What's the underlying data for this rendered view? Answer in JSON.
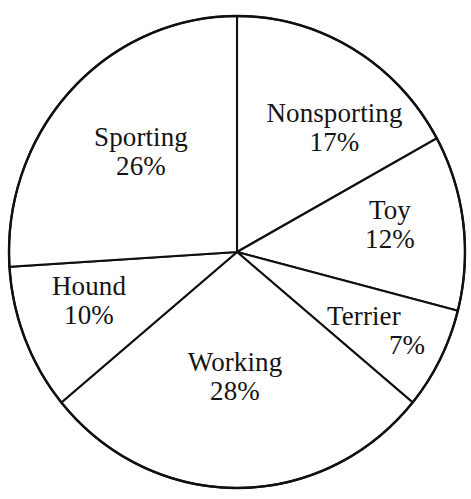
{
  "chart_data": {
    "type": "pie",
    "title": "",
    "subtitle": "",
    "xlabel": "",
    "ylabel": "",
    "legend": "none",
    "grid": false,
    "units": "percent",
    "total": 100,
    "start_angle_deg": 0,
    "direction": "clockwise",
    "categories": [
      "Nonsporting",
      "Toy",
      "Terrier",
      "Working",
      "Hound",
      "Sporting"
    ],
    "values": [
      17,
      12,
      7,
      28,
      10,
      26
    ],
    "slices": [
      {
        "name": "Nonsporting",
        "value": 17,
        "value_label": "17%",
        "start_deg": 0,
        "end_deg": 61.2,
        "color": "#ffffff",
        "outline": "#101010"
      },
      {
        "name": "Toy",
        "value": 12,
        "value_label": "12%",
        "start_deg": 61.2,
        "end_deg": 104.4,
        "color": "#ffffff",
        "outline": "#101010"
      },
      {
        "name": "Terrier",
        "value": 7,
        "value_label": "7%",
        "start_deg": 104.4,
        "end_deg": 129.6,
        "color": "#ffffff",
        "outline": "#101010"
      },
      {
        "name": "Working",
        "value": 28,
        "value_label": "28%",
        "start_deg": 129.6,
        "end_deg": 230.4,
        "color": "#ffffff",
        "outline": "#101010"
      },
      {
        "name": "Hound",
        "value": 10,
        "value_label": "10%",
        "start_deg": 230.4,
        "end_deg": 266.4,
        "color": "#ffffff",
        "outline": "#101010"
      },
      {
        "name": "Sporting",
        "value": 26,
        "value_label": "26%",
        "start_deg": 266.4,
        "end_deg": 360,
        "color": "#ffffff",
        "outline": "#101010"
      }
    ]
  },
  "labels": {
    "sporting": {
      "name": "Sporting",
      "value": "26%"
    },
    "nonsporting": {
      "name": "Nonsporting",
      "value": "17%"
    },
    "toy": {
      "name": "Toy",
      "value": "12%"
    },
    "terrier": {
      "name": "Terrier",
      "value": "7%"
    },
    "hound": {
      "name": "Hound",
      "value": "10%"
    },
    "working": {
      "name": "Working",
      "value": "28%"
    }
  },
  "style": {
    "background": "#ffffff",
    "stroke": "#101010",
    "text": "#141414"
  }
}
